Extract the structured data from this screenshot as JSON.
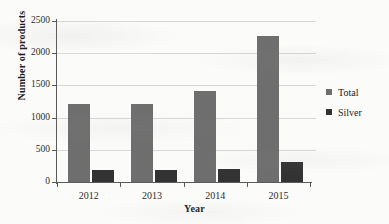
{
  "chart_data": {
    "type": "bar",
    "title": "",
    "xlabel": "Year",
    "ylabel": "Number of products",
    "categories": [
      "2012",
      "2013",
      "2014",
      "2015"
    ],
    "series": [
      {
        "name": "Total",
        "color": "#6e6e6e",
        "values": [
          1210,
          1215,
          1420,
          2260
        ]
      },
      {
        "name": "Silver",
        "color": "#333333",
        "values": [
          180,
          185,
          200,
          310
        ]
      }
    ],
    "ylim": [
      0,
      2500
    ],
    "yticks": [
      0,
      500,
      1000,
      1500,
      2000,
      2500
    ],
    "ytick_labels": [
      "0",
      "500",
      "1000",
      "1500",
      "2000",
      "2500"
    ],
    "grid": true,
    "grid_axis": "y",
    "legend_position": "right"
  }
}
